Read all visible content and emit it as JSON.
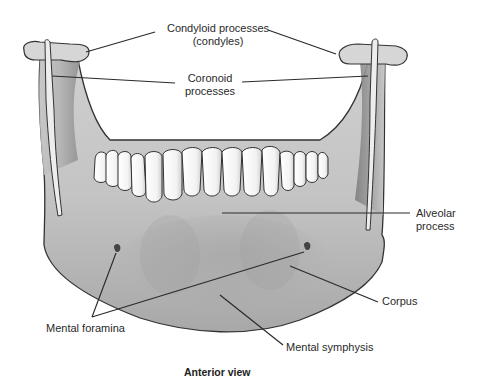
{
  "figure": {
    "caption": "Anterior view",
    "colors": {
      "bone_light": "#e4e4e4",
      "bone_mid": "#bdbdbd",
      "bone_dark": "#7a7a7a",
      "outline": "#333333",
      "tooth": "#ffffff",
      "leader": "#2a2a2a"
    },
    "labels": {
      "condyloid": {
        "line1": "Condyloid processes",
        "line2": "(condyles)"
      },
      "coronoid": {
        "line1": "Coronoid",
        "line2": "processes"
      },
      "alveolar": {
        "line1": "Alveolar",
        "line2": "process"
      },
      "corpus": "Corpus",
      "mental_foramina": "Mental foramina",
      "mental_symphysis": "Mental symphysis"
    }
  }
}
